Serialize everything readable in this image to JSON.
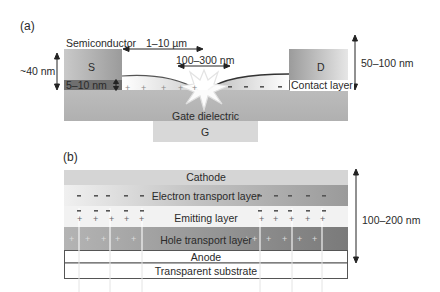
{
  "panel_a": {
    "label": "(a)",
    "semiconductor": "Semiconductor",
    "source": "S",
    "drain": "D",
    "gate": "G",
    "gate_dielectric": "Gate dielectric",
    "contact_layer": "Contact layer",
    "dim_channel_length": "1–10 µm",
    "dim_emission_zone": "100–300 nm",
    "dim_source_height": "~40 nm",
    "dim_contact_thickness": "5–10 nm",
    "dim_total_height": "50–100 nm",
    "hole_charges": "+  +  +  +  +",
    "electron_charges": "-   -   -   -"
  },
  "panel_b": {
    "label": "(b)",
    "layers": [
      {
        "name": "Cathode"
      },
      {
        "name": "Electron transport layer"
      },
      {
        "name": "Emitting layer"
      },
      {
        "name": "Hole transport layer"
      },
      {
        "name": "Anode"
      },
      {
        "name": "Transparent substrate"
      }
    ],
    "dim_total_height": "100–200 nm",
    "minus": "-",
    "plus": "+"
  },
  "colors": {
    "electrode": "#a8a8a8",
    "contact_dark": "#6e6e6e",
    "dielectric": "#b9b9b9",
    "gate": "#d6d6d6",
    "cathode": "#d3d3d3",
    "etl": "#a9a9a9",
    "emitting": "#f1f1f1",
    "htl": "#8c8c8c"
  }
}
